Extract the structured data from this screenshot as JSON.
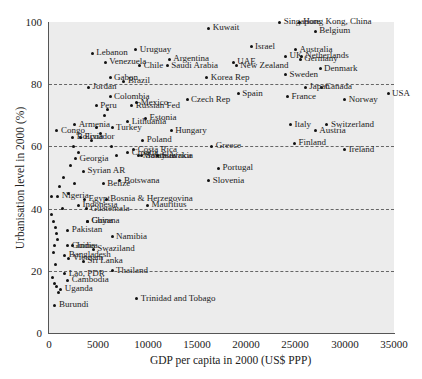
{
  "chart_data": {
    "type": "scatter",
    "title": "",
    "xlabel": "GDP per capita in 2000 (US$ PPP)",
    "ylabel": "Urbanisation level in 2000 (%)",
    "xlim": [
      0,
      35000
    ],
    "ylim": [
      0,
      100
    ],
    "xticks": [
      "0",
      "5000",
      "10000",
      "15000",
      "20000",
      "25000",
      "30000",
      "35000"
    ],
    "yticks": [
      "0",
      "20",
      "40",
      "60",
      "80",
      "100"
    ],
    "grid": "horizontal dashed at 20, 40, 60, 80",
    "legend": "none",
    "points": [
      {
        "name": "Kuwait",
        "x": 16200,
        "y": 98
      },
      {
        "name": "Singapore",
        "x": 23400,
        "y": 100
      },
      {
        "name": "Hong Kong, China",
        "x": 25400,
        "y": 100
      },
      {
        "name": "Belgium",
        "x": 27000,
        "y": 97
      },
      {
        "name": "Israel",
        "x": 20500,
        "y": 92
      },
      {
        "name": "UK",
        "x": 24000,
        "y": 89
      },
      {
        "name": "Australia",
        "x": 25000,
        "y": 91
      },
      {
        "name": "New Zealand",
        "x": 19000,
        "y": 86
      },
      {
        "name": "Sweden",
        "x": 24000,
        "y": 83
      },
      {
        "name": "Denmark",
        "x": 27500,
        "y": 85
      },
      {
        "name": "Venezuela",
        "x": 5700,
        "y": 87
      },
      {
        "name": "Uruguay",
        "x": 8800,
        "y": 91
      },
      {
        "name": "Argentina",
        "x": 12200,
        "y": 88
      },
      {
        "name": "Lebanon",
        "x": 4400,
        "y": 90
      },
      {
        "name": "Chile",
        "x": 9200,
        "y": 86
      },
      {
        "name": "Jordan",
        "x": 4000,
        "y": 79
      },
      {
        "name": "Gabon",
        "x": 6200,
        "y": 82
      },
      {
        "name": "Brazil",
        "x": 7600,
        "y": 81
      },
      {
        "name": "Saudi Arabia",
        "x": 12000,
        "y": 86
      },
      {
        "name": "Korea Rep",
        "x": 16000,
        "y": 82
      },
      {
        "name": "UAE",
        "x": 18700,
        "y": 87
      },
      {
        "name": "Canada",
        "x": 27600,
        "y": 79
      },
      {
        "name": "USA",
        "x": 34400,
        "y": 77
      },
      {
        "name": "Spain",
        "x": 19200,
        "y": 77
      },
      {
        "name": "France",
        "x": 24200,
        "y": 76
      },
      {
        "name": "Germany",
        "x": 25500,
        "y": 88
      },
      {
        "name": "Netherlands",
        "x": 25600,
        "y": 89
      },
      {
        "name": "Norway",
        "x": 30000,
        "y": 75
      },
      {
        "name": "Switzerland",
        "x": 28200,
        "y": 67
      },
      {
        "name": "Russian Fed",
        "x": 8400,
        "y": 73
      },
      {
        "name": "Mexico",
        "x": 8900,
        "y": 74
      },
      {
        "name": "Czech Rep",
        "x": 14000,
        "y": 75
      },
      {
        "name": "Peru",
        "x": 4800,
        "y": 73
      },
      {
        "name": "Colombia",
        "x": 6200,
        "y": 76
      },
      {
        "name": "Estonia",
        "x": 9800,
        "y": 69
      },
      {
        "name": "Armenia",
        "x": 2600,
        "y": 67
      },
      {
        "name": "Lithuania",
        "x": 8000,
        "y": 68
      },
      {
        "name": "Turkey",
        "x": 6400,
        "y": 66
      },
      {
        "name": "Hungary",
        "x": 12400,
        "y": 65
      },
      {
        "name": "Malaysia",
        "x": 9100,
        "y": 57
      },
      {
        "name": "Bolivia",
        "x": 2400,
        "y": 63
      },
      {
        "name": "Ecuador",
        "x": 3200,
        "y": 63
      },
      {
        "name": "Poland",
        "x": 9500,
        "y": 62
      },
      {
        "name": "Italy",
        "x": 24500,
        "y": 67
      },
      {
        "name": "Japan",
        "x": 26000,
        "y": 79
      },
      {
        "name": "Austria",
        "x": 27000,
        "y": 65
      },
      {
        "name": "Finland",
        "x": 24900,
        "y": 61
      },
      {
        "name": "Ireland",
        "x": 30000,
        "y": 59
      },
      {
        "name": "Congo",
        "x": 800,
        "y": 65
      },
      {
        "name": "South Africa",
        "x": 9400,
        "y": 57
      },
      {
        "name": "Costa Rica",
        "x": 8600,
        "y": 59
      },
      {
        "name": "Slovakia",
        "x": 11000,
        "y": 57
      },
      {
        "name": "Croatia",
        "x": 8000,
        "y": 58
      },
      {
        "name": "Botswana",
        "x": 7200,
        "y": 49
      },
      {
        "name": "Georgia",
        "x": 2700,
        "y": 56
      },
      {
        "name": "Greece",
        "x": 16500,
        "y": 60
      },
      {
        "name": "Portugal",
        "x": 17200,
        "y": 53
      },
      {
        "name": "Slovenia",
        "x": 16200,
        "y": 49
      },
      {
        "name": "Syrian AR",
        "x": 3500,
        "y": 52
      },
      {
        "name": "Belize",
        "x": 5500,
        "y": 48
      },
      {
        "name": "Nigeria",
        "x": 900,
        "y": 44
      },
      {
        "name": "Egypt",
        "x": 3600,
        "y": 43
      },
      {
        "name": "Guatemala",
        "x": 3800,
        "y": 40
      },
      {
        "name": "Bosnia & Herzegovina",
        "x": 5800,
        "y": 43
      },
      {
        "name": "Mauritius",
        "x": 10000,
        "y": 41
      },
      {
        "name": "Indonesia",
        "x": 3000,
        "y": 41
      },
      {
        "name": "China",
        "x": 3900,
        "y": 36
      },
      {
        "name": "Pakistan",
        "x": 1900,
        "y": 33
      },
      {
        "name": "Namibia",
        "x": 6400,
        "y": 31
      },
      {
        "name": "Guinea",
        "x": 1900,
        "y": 28
      },
      {
        "name": "Thailand",
        "x": 6400,
        "y": 20
      },
      {
        "name": "India",
        "x": 2400,
        "y": 28
      },
      {
        "name": "Guyana",
        "x": 3900,
        "y": 36
      },
      {
        "name": "Vietnam",
        "x": 2000,
        "y": 24
      },
      {
        "name": "Swaziland",
        "x": 4500,
        "y": 27
      },
      {
        "name": "Bangladesh",
        "x": 1600,
        "y": 25
      },
      {
        "name": "Lao, PDR",
        "x": 1600,
        "y": 19
      },
      {
        "name": "Cambodia",
        "x": 1900,
        "y": 17
      },
      {
        "name": "Sri Lanka",
        "x": 3500,
        "y": 23
      },
      {
        "name": "Uganda",
        "x": 1200,
        "y": 14
      },
      {
        "name": "Burundi",
        "x": 600,
        "y": 9
      },
      {
        "name": "Trinidad and Tobago",
        "x": 8900,
        "y": 11
      }
    ]
  },
  "chart": {
    "xlabel": "GDP per capita in 2000 (US$ PPP)",
    "ylabel": "Urbanisation level in 2000 (%)",
    "xticks": [
      "0",
      "5000",
      "10000",
      "15000",
      "20000",
      "25000",
      "30000",
      "35000"
    ],
    "yticks": [
      "0",
      "20",
      "40",
      "60",
      "80",
      "100"
    ]
  }
}
